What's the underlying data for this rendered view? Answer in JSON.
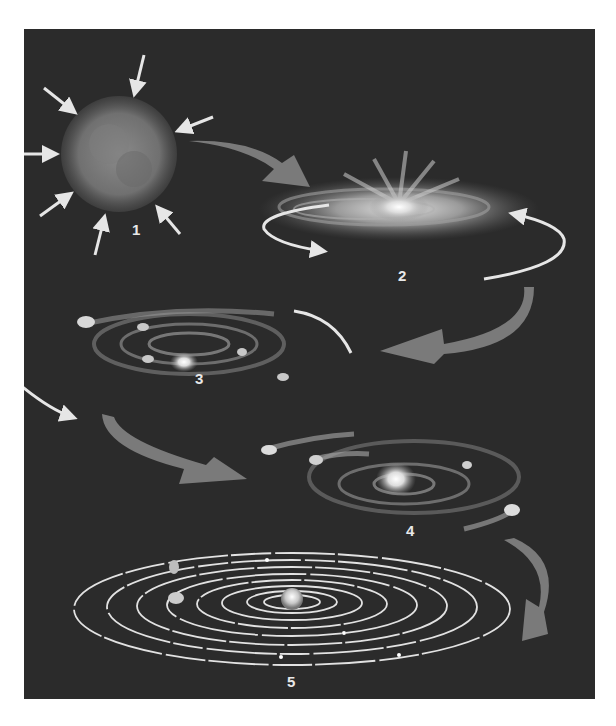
{
  "figure": {
    "background_color": "#2b2b2b",
    "arrow_color": "#7a7a7a",
    "line_color": "#e6e6e6"
  },
  "stages": [
    {
      "number": "1",
      "name": "collapsing-nebula",
      "label_pos": [
        108,
        222
      ]
    },
    {
      "number": "2",
      "name": "rotating-disk",
      "label_pos": [
        374,
        240
      ]
    },
    {
      "number": "3",
      "name": "protoplanetary-disk",
      "label_pos": [
        171,
        343
      ]
    },
    {
      "number": "4",
      "name": "planetesimal-formation",
      "label_pos": [
        385,
        496
      ]
    },
    {
      "number": "5",
      "name": "solar-system",
      "label_pos": [
        266,
        646
      ]
    }
  ]
}
